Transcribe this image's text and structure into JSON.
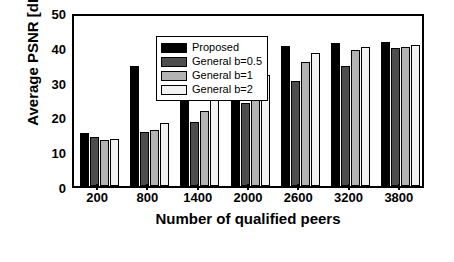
{
  "chart_data": {
    "type": "bar",
    "title": "",
    "xlabel": "Number of qualified peers",
    "ylabel": "Average PSNR [dB]",
    "categories": [
      "200",
      "800",
      "1400",
      "2000",
      "2600",
      "3200",
      "3800"
    ],
    "ylim": [
      0,
      50
    ],
    "yticks": [
      0,
      10,
      20,
      30,
      40,
      50
    ],
    "ytick_labels": [
      "0",
      "10",
      "20",
      "30",
      "40",
      "50"
    ],
    "grid": false,
    "legend_position": "top-left",
    "series": [
      {
        "name": "Proposed",
        "color": "#000000",
        "values": [
          15.2,
          34.6,
          38.4,
          39.6,
          40.3,
          41.2,
          41.3
        ]
      },
      {
        "name": "General b=0.5",
        "color": "#4d4d4d",
        "values": [
          14.2,
          15.4,
          18.4,
          23.8,
          30.2,
          34.5,
          39.6
        ]
      },
      {
        "name": "General b=1",
        "color": "#b3b3b3",
        "values": [
          13.3,
          16.0,
          21.6,
          27.0,
          35.5,
          39.1,
          40.0
        ]
      },
      {
        "name": "General b=2",
        "color": "#f2f2f2",
        "values": [
          13.5,
          18.0,
          28.3,
          32.0,
          38.3,
          40.0,
          40.6
        ]
      }
    ]
  }
}
